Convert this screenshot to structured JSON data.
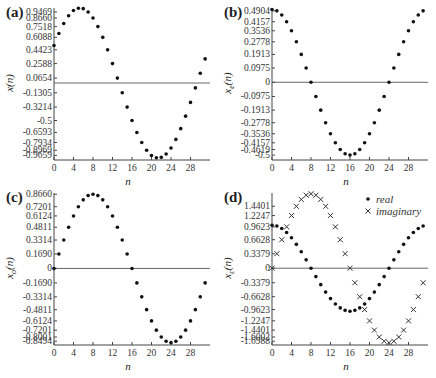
{
  "chart_data": [
    {
      "id": "a",
      "panel_label": "(a)",
      "type": "scatter",
      "xlabel": "n",
      "ylabel": "x(n)",
      "x": [
        0,
        1,
        2,
        3,
        4,
        5,
        6,
        7,
        8,
        9,
        10,
        11,
        12,
        13,
        14,
        15,
        16,
        17,
        18,
        19,
        20,
        21,
        22,
        23,
        24,
        25,
        26,
        27,
        28,
        29,
        30,
        31
      ],
      "series": [
        {
          "name": "x(n)",
          "marker": "dot",
          "values": [
            0.5,
            0.6593,
            0.7934,
            0.8969,
            0.9659,
            0.9969,
            0.9914,
            0.9469,
            0.866,
            0.7518,
            0.6088,
            0.4423,
            0.2588,
            0.0654,
            -0.1305,
            -0.3214,
            -0.5,
            -0.6593,
            -0.7934,
            -0.8969,
            -0.9659,
            -0.9969,
            -0.9914,
            -0.9469,
            -0.866,
            -0.7518,
            -0.6088,
            -0.4423,
            -0.2588,
            -0.0654,
            0.1305,
            0.3214
          ]
        }
      ],
      "yticks": [
        0.9469,
        0.866,
        0.7518,
        0.6088,
        0.4423,
        0.2588,
        0.0654,
        -0.1305,
        -0.3214,
        -0.5,
        -0.6593,
        -0.7934,
        -0.8969,
        -0.9659
      ],
      "ytick_labels": [
        "0.9469",
        "0.8660",
        "0.7518",
        "0.6088",
        "0.4423",
        "0.2588",
        "0.0654",
        "-0.1305",
        "-0.3214",
        "-0.5",
        "-0.6593",
        "-0.7934",
        "-0.8969",
        "-0.9659"
      ],
      "xticks": [
        0,
        4,
        8,
        12,
        16,
        20,
        24,
        28
      ],
      "xlim": [
        0,
        32
      ],
      "ylim": [
        -1.0,
        1.0
      ],
      "zero_line": true,
      "grid": false
    },
    {
      "id": "b",
      "panel_label": "(b)",
      "type": "scatter",
      "xlabel": "n",
      "ylabel": "x_e(n)",
      "x": [
        0,
        1,
        2,
        3,
        4,
        5,
        6,
        7,
        8,
        9,
        10,
        11,
        12,
        13,
        14,
        15,
        16,
        17,
        18,
        19,
        20,
        21,
        22,
        23,
        24,
        25,
        26,
        27,
        28,
        29,
        30,
        31
      ],
      "series": [
        {
          "name": "x_e(n)",
          "marker": "dot",
          "values": [
            0.5,
            0.4904,
            0.4619,
            0.4157,
            0.3536,
            0.2778,
            0.1913,
            0.0975,
            0,
            -0.0975,
            -0.1913,
            -0.2778,
            -0.3536,
            -0.4157,
            -0.4619,
            -0.4904,
            -0.5,
            -0.4904,
            -0.4619,
            -0.4157,
            -0.3536,
            -0.2778,
            -0.1913,
            -0.0975,
            0,
            0.0975,
            0.1913,
            0.2778,
            0.3536,
            0.4157,
            0.4619,
            0.4904
          ]
        }
      ],
      "yticks": [
        0.4904,
        0.4157,
        0.3536,
        0.2778,
        0.1913,
        0.0975,
        0,
        -0.0975,
        -0.1913,
        -0.2778,
        -0.3536,
        -0.4157,
        -0.4619,
        -0.5
      ],
      "ytick_labels": [
        "0.4904",
        "0.4157",
        "0.3536",
        "0.2778",
        "0.1913",
        "0.0975",
        "0",
        "-0.0975",
        "-0.1913",
        "-0.2778",
        "-0.3536",
        "-0.4157",
        "-0.4619",
        "-0.5"
      ],
      "xticks": [
        0,
        4,
        8,
        12,
        16,
        20,
        24,
        28
      ],
      "xlim": [
        0,
        32
      ],
      "ylim": [
        -0.52,
        0.51
      ],
      "zero_line": true,
      "grid": false
    },
    {
      "id": "c",
      "panel_label": "(c)",
      "type": "scatter",
      "xlabel": "n",
      "ylabel": "x_o(n)",
      "x": [
        0,
        1,
        2,
        3,
        4,
        5,
        6,
        7,
        8,
        9,
        10,
        11,
        12,
        13,
        14,
        15,
        16,
        17,
        18,
        19,
        20,
        21,
        22,
        23,
        24,
        25,
        26,
        27,
        28,
        29,
        30,
        31
      ],
      "series": [
        {
          "name": "x_o(n)",
          "marker": "dot",
          "values": [
            0,
            0.169,
            0.3314,
            0.4811,
            0.6124,
            0.7201,
            0.8001,
            0.8494,
            0.866,
            0.8494,
            0.8001,
            0.7201,
            0.6124,
            0.4811,
            0.3314,
            0.169,
            0,
            -0.169,
            -0.3314,
            -0.4811,
            -0.6124,
            -0.7201,
            -0.8001,
            -0.8494,
            -0.866,
            -0.8494,
            -0.8001,
            -0.7201,
            -0.6124,
            -0.4811,
            -0.3314,
            -0.169
          ]
        }
      ],
      "yticks": [
        0.866,
        0.7201,
        0.6124,
        0.4811,
        0.3314,
        0.169,
        0,
        -0.169,
        -0.3314,
        -0.4811,
        -0.6124,
        -0.7201,
        -0.8001,
        -0.8494
      ],
      "ytick_labels": [
        "0.8660",
        "0.7201",
        "0.6124",
        "0.4811",
        "0.3314",
        "0.1690",
        "0",
        "-0.1690",
        "-0.3314",
        "-0.4811",
        "-0.6124",
        "-0.7201",
        "-0.8001",
        "-0.8494"
      ],
      "xticks": [
        0,
        4,
        8,
        12,
        16,
        20,
        24,
        28
      ],
      "xlim": [
        0,
        32
      ],
      "ylim": [
        -0.87,
        0.88
      ],
      "zero_line": true,
      "grid": false
    },
    {
      "id": "d",
      "panel_label": "(d)",
      "type": "scatter",
      "xlabel": "n",
      "ylabel": "x_c(n)",
      "x": [
        0,
        1,
        2,
        3,
        4,
        5,
        6,
        7,
        8,
        9,
        10,
        11,
        12,
        13,
        14,
        15,
        16,
        17,
        18,
        19,
        20,
        21,
        22,
        23,
        24,
        25,
        26,
        27,
        28,
        29,
        30,
        31
      ],
      "series": [
        {
          "name": "real",
          "marker": "dot",
          "values": [
            1.0,
            0.9808,
            0.9239,
            0.8315,
            0.7071,
            0.5556,
            0.3827,
            0.1951,
            0,
            -0.1951,
            -0.3827,
            -0.5556,
            -0.7071,
            -0.8315,
            -0.9239,
            -0.9808,
            -1.0,
            -0.9808,
            -0.9239,
            -0.8315,
            -0.7071,
            -0.5556,
            -0.3827,
            -0.1951,
            0,
            0.1951,
            0.3827,
            0.5556,
            0.7071,
            0.8315,
            0.9239,
            0.9808
          ]
        },
        {
          "name": "imaginary",
          "marker": "x",
          "values": [
            0,
            0.3379,
            0.6628,
            0.9623,
            1.2247,
            1.4401,
            1.6002,
            1.6988,
            1.7321,
            1.6988,
            1.6002,
            1.4401,
            1.2247,
            0.9623,
            0.6628,
            0.3379,
            0,
            -0.3379,
            -0.6628,
            -0.9623,
            -1.2247,
            -1.4401,
            -1.6002,
            -1.6988,
            -1.7321,
            -1.6988,
            -1.6002,
            -1.4401,
            -1.2247,
            -0.9623,
            -0.6628,
            -0.3379
          ]
        }
      ],
      "legend": {
        "position": "upper-right",
        "entries": [
          "real",
          "imaginary"
        ]
      },
      "yticks": [
        1.4401,
        1.2247,
        0.9623,
        0.6628,
        0.3379,
        0,
        -0.3379,
        -0.6628,
        -0.9623,
        -1.2247,
        -1.4401,
        -1.6002,
        -1.6988
      ],
      "ytick_labels": [
        "1.4401",
        "1.2247",
        "0.9623",
        "0.6628",
        "0.3379",
        "0",
        "-0.3379",
        "-0.6628",
        "-0.9623",
        "-1.2247",
        "-1.4401",
        "-1.6002",
        "-1.6988"
      ],
      "xticks": [
        0,
        4,
        8,
        12,
        16,
        20,
        24,
        28
      ],
      "xlim": [
        0,
        32
      ],
      "ylim": [
        -1.74,
        1.75
      ],
      "zero_line": true,
      "grid": false
    }
  ],
  "panels": {
    "a": {
      "label": "(a)",
      "ylabel": "x(n)",
      "xlabel": "n"
    },
    "b": {
      "label": "(b)",
      "ylabel": "x_e(n)",
      "xlabel": "n"
    },
    "c": {
      "label": "(c)",
      "ylabel": "x_o(n)",
      "xlabel": "n"
    },
    "d": {
      "label": "(d)",
      "ylabel": "x_c(n)",
      "xlabel": "n",
      "legend_real": "real",
      "legend_imag": "imaginary"
    }
  }
}
